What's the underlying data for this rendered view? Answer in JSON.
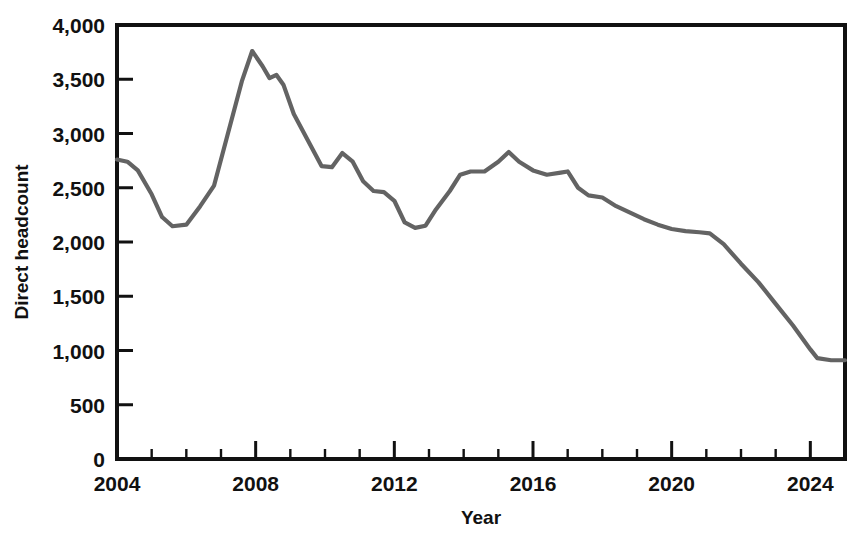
{
  "chart_data": {
    "type": "line",
    "title": "",
    "subtitle": "",
    "xlabel": "Year",
    "ylabel": "Direct headcount",
    "xlim": [
      2004,
      2025
    ],
    "ylim": [
      0,
      4000
    ],
    "grid": false,
    "legend_position": "none",
    "line_color": "#636363",
    "axis_color": "#111111",
    "y_ticks": [
      0,
      500,
      1000,
      1500,
      2000,
      2500,
      3000,
      3500,
      4000
    ],
    "y_tick_labels": [
      "0",
      "500",
      "1,000",
      "1,500",
      "2,000",
      "2,500",
      "3,000",
      "3,500",
      "4,000"
    ],
    "x_ticks": [
      2004,
      2008,
      2012,
      2016,
      2020,
      2024
    ],
    "x_tick_labels": [
      "2004",
      "2008",
      "2012",
      "2016",
      "2020",
      "2024"
    ],
    "x_minor_ticks": [
      2005,
      2006,
      2007,
      2009,
      2010,
      2011,
      2013,
      2014,
      2015,
      2017,
      2018,
      2019,
      2021,
      2022,
      2023,
      2025
    ],
    "series": [
      {
        "name": "Direct headcount",
        "x": [
          2004.0,
          2004.3,
          2004.6,
          2005.0,
          2005.3,
          2005.6,
          2006.0,
          2006.4,
          2006.8,
          2007.2,
          2007.6,
          2007.9,
          2008.2,
          2008.4,
          2008.6,
          2008.8,
          2009.1,
          2009.5,
          2009.9,
          2010.2,
          2010.5,
          2010.8,
          2011.1,
          2011.4,
          2011.7,
          2012.0,
          2012.3,
          2012.6,
          2012.9,
          2013.2,
          2013.6,
          2013.9,
          2014.2,
          2014.6,
          2015.0,
          2015.3,
          2015.6,
          2016.0,
          2016.4,
          2016.8,
          2017.0,
          2017.3,
          2017.6,
          2018.0,
          2018.4,
          2018.8,
          2019.2,
          2019.6,
          2020.0,
          2020.4,
          2020.8,
          2021.1,
          2021.5,
          2022.0,
          2022.5,
          2023.0,
          2023.5,
          2024.0,
          2024.2,
          2024.6,
          2025.0
        ],
        "y": [
          2760,
          2740,
          2660,
          2440,
          2230,
          2145,
          2160,
          2330,
          2520,
          3000,
          3480,
          3760,
          3620,
          3510,
          3540,
          3450,
          3180,
          2940,
          2700,
          2690,
          2820,
          2740,
          2560,
          2470,
          2460,
          2380,
          2180,
          2130,
          2150,
          2300,
          2470,
          2620,
          2650,
          2650,
          2740,
          2830,
          2740,
          2660,
          2620,
          2640,
          2650,
          2500,
          2430,
          2410,
          2330,
          2270,
          2210,
          2160,
          2120,
          2100,
          2090,
          2080,
          1980,
          1800,
          1630,
          1430,
          1230,
          1010,
          930,
          910,
          910
        ]
      }
    ]
  }
}
